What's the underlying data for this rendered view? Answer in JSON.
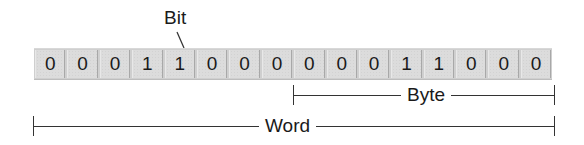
{
  "diagram": {
    "bit_label": "Bit",
    "bits": [
      "0",
      "0",
      "0",
      "1",
      "1",
      "0",
      "0",
      "0",
      "0",
      "0",
      "0",
      "1",
      "1",
      "0",
      "0",
      "0"
    ],
    "pointed_bit_index": 4,
    "byte_label": "Byte",
    "word_label": "Word",
    "byte_span": {
      "start_index": 8,
      "end_index": 15
    },
    "word_span": {
      "start_index": 0,
      "end_index": 15
    }
  }
}
